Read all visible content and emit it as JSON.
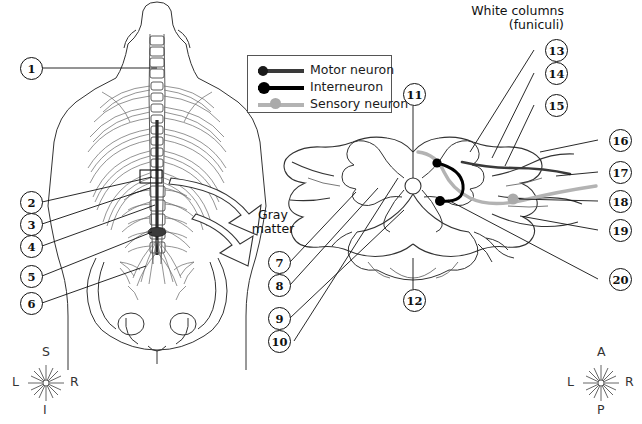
{
  "figure": {
    "title_hidden": "",
    "annotations": {
      "white_columns": "White columns",
      "white_columns_sub": "(funiculi)",
      "gray_matter_line1": "Gray",
      "gray_matter_line2": "matter"
    }
  },
  "legend": {
    "items": [
      {
        "label": "Motor neuron",
        "color": "#3a3a3a",
        "dot": "#1a1a1a",
        "dot_size": 5
      },
      {
        "label": "Interneuron",
        "color": "#000000",
        "dot": "#000000",
        "dot_size": 7
      },
      {
        "label": "Sensory neuron",
        "color": "#b3b3b3",
        "dot": "#aaaaaa",
        "dot_size": 6
      }
    ]
  },
  "callouts": {
    "left": [
      {
        "n": "1"
      },
      {
        "n": "2"
      },
      {
        "n": "3"
      },
      {
        "n": "4"
      },
      {
        "n": "5"
      },
      {
        "n": "6"
      }
    ],
    "middle": [
      {
        "n": "7"
      },
      {
        "n": "8"
      },
      {
        "n": "9"
      },
      {
        "n": "10"
      }
    ],
    "vertical": [
      {
        "n": "11"
      },
      {
        "n": "12"
      }
    ],
    "upper_right": [
      {
        "n": "13"
      },
      {
        "n": "14"
      },
      {
        "n": "15"
      }
    ],
    "right": [
      {
        "n": "16"
      },
      {
        "n": "17"
      },
      {
        "n": "18"
      },
      {
        "n": "19"
      },
      {
        "n": "20"
      }
    ]
  },
  "compass_left": {
    "top": "S",
    "bottom": "I",
    "left": "L",
    "right": "R"
  },
  "compass_right": {
    "top": "A",
    "bottom": "P",
    "left": "L",
    "right": "R"
  },
  "colors": {
    "ink": "#111111",
    "outline": "#333333",
    "bone": "#5a5a5a",
    "soft": "#9a9a9a",
    "sensory": "#b3b3b3",
    "white": "#ffffff"
  }
}
